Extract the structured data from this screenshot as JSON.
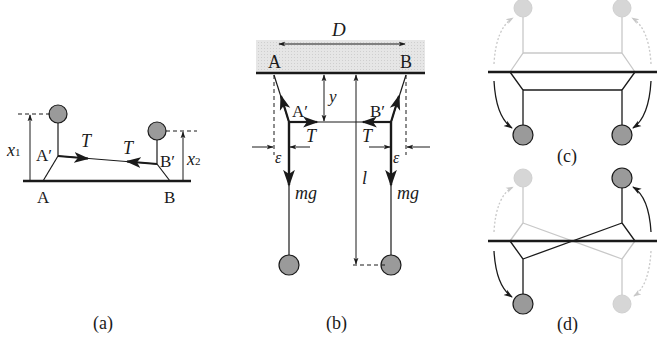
{
  "figure": {
    "panels": [
      {
        "id": "a",
        "caption": "(a)",
        "labels": {
          "point_a": "A",
          "point_b": "B",
          "point_a_prime": "A′",
          "point_b_prime": "B′",
          "height_1": "x",
          "height_1_sub": "1",
          "height_2": "x",
          "height_2_sub": "2",
          "tension_left": "T",
          "tension_right": "T"
        }
      },
      {
        "id": "b",
        "caption": "(b)",
        "labels": {
          "separation": "D",
          "point_a": "A",
          "point_b": "B",
          "point_a_prime": "A′",
          "point_b_prime": "B′",
          "drop": "y",
          "length": "l",
          "tension_left": "T",
          "tension_right": "T",
          "offset_left": "ε",
          "offset_right": "ε",
          "weight_left": "mg",
          "weight_right": "mg"
        }
      },
      {
        "id": "c",
        "caption": "(c)"
      },
      {
        "id": "d",
        "caption": "(d)"
      }
    ],
    "colors": {
      "line": "#1a1a1a",
      "ball_fill": "#9a9a9a",
      "ghost": "#c8c8c8",
      "ghost_ball": "#d6d6d6",
      "ceiling_band": "#e4e4e4"
    }
  }
}
